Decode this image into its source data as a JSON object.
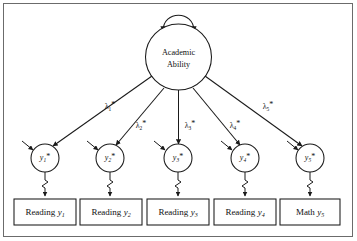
{
  "diagram": {
    "type": "path-diagram",
    "model": "confirmatory-factor-analysis",
    "latent_factor": {
      "name": "academic-ability",
      "label_line1": "Academic",
      "label_line2": "Ability",
      "has_variance_loop": true
    },
    "loadings": [
      {
        "id": "lambda-1",
        "label": "λ",
        "subscript": "1",
        "superscript": "*"
      },
      {
        "id": "lambda-2",
        "label": "λ",
        "subscript": "2",
        "superscript": "*"
      },
      {
        "id": "lambda-3",
        "label": "λ",
        "subscript": "3",
        "superscript": "*"
      },
      {
        "id": "lambda-4",
        "label": "λ",
        "subscript": "4",
        "superscript": "*"
      },
      {
        "id": "lambda-5",
        "label": "λ",
        "subscript": "5",
        "superscript": "*"
      }
    ],
    "latent_responses": [
      {
        "id": "y1-star",
        "label": "y",
        "subscript": "1",
        "superscript": "*"
      },
      {
        "id": "y2-star",
        "label": "y",
        "subscript": "2",
        "superscript": "*"
      },
      {
        "id": "y3-star",
        "label": "y",
        "subscript": "3",
        "superscript": "*"
      },
      {
        "id": "y4-star",
        "label": "y",
        "subscript": "4",
        "superscript": "*"
      },
      {
        "id": "y5-star",
        "label": "y",
        "subscript": "5",
        "superscript": "*"
      }
    ],
    "indicators": [
      {
        "id": "indicator-1",
        "text": "Reading",
        "variable": "y",
        "subscript": "1"
      },
      {
        "id": "indicator-2",
        "text": "Reading",
        "variable": "y",
        "subscript": "2"
      },
      {
        "id": "indicator-3",
        "text": "Reading",
        "variable": "y",
        "subscript": "3"
      },
      {
        "id": "indicator-4",
        "text": "Reading",
        "variable": "y",
        "subscript": "4"
      },
      {
        "id": "indicator-5",
        "text": "Math",
        "variable": "y",
        "subscript": "5"
      }
    ],
    "colors": {
      "stroke": "#1a1a1a",
      "frame": "#6b6b6b",
      "background": "#ffffff",
      "text": "#111111"
    }
  }
}
